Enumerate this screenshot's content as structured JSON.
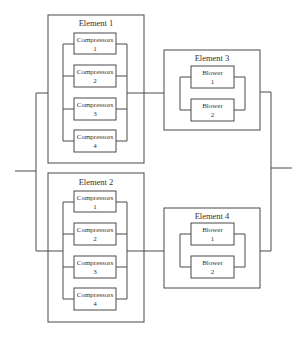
{
  "diagram": {
    "type": "reliability-block-diagram",
    "elements": [
      {
        "id": "element-1",
        "title": "Element 1",
        "components": [
          {
            "name": "Compressors",
            "number": "1"
          },
          {
            "name": "Compressors",
            "number": "2"
          },
          {
            "name": "Compressors",
            "number": "3"
          },
          {
            "name": "Compressors",
            "number": "4"
          }
        ]
      },
      {
        "id": "element-2",
        "title": "Element 2",
        "components": [
          {
            "name": "Compressors",
            "number": "1"
          },
          {
            "name": "Compressors",
            "number": "2"
          },
          {
            "name": "Compressors",
            "number": "3"
          },
          {
            "name": "Compressors",
            "number": "4"
          }
        ]
      },
      {
        "id": "element-3",
        "title": "Element 3",
        "components": [
          {
            "name": "Blower",
            "number": "1"
          },
          {
            "name": "Blower",
            "number": "2"
          }
        ]
      },
      {
        "id": "element-4",
        "title": "Element 4",
        "components": [
          {
            "name": "Blower",
            "number": "1"
          },
          {
            "name": "Blower",
            "number": "2"
          }
        ]
      }
    ],
    "connections": [
      {
        "from": "element-1",
        "to": "element-3",
        "type": "series"
      },
      {
        "from": "element-2",
        "to": "element-4",
        "type": "series"
      },
      {
        "paths": [
          "element-1 → element-3",
          "element-2 → element-4"
        ],
        "type": "parallel"
      }
    ],
    "colors": {
      "line": "#4a4a4a",
      "text": "#333333",
      "background": "#ffffff"
    }
  }
}
